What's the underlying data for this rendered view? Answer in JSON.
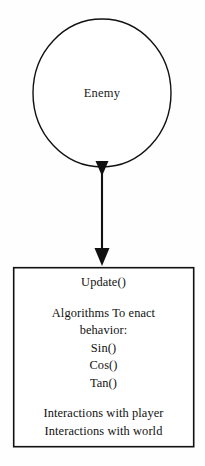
{
  "diagram": {
    "background_color": "#fefefe",
    "stroke_color": "#111111",
    "nodes": {
      "enemy": {
        "shape": "circle",
        "label": "Enemy",
        "center_x": 102,
        "center_y": 93,
        "radius": 69
      },
      "behavior": {
        "shape": "rectangle",
        "x": 13,
        "y": 267,
        "width": 181,
        "height": 180,
        "lines": [
          {
            "text": "Update()",
            "kind": "method"
          },
          {
            "text": "",
            "kind": "spacer"
          },
          {
            "text": "Algorithms To enact",
            "kind": "heading"
          },
          {
            "text": "behavior:",
            "kind": "heading"
          },
          {
            "text": "Sin()",
            "kind": "method"
          },
          {
            "text": "Cos()",
            "kind": "method"
          },
          {
            "text": "Tan()",
            "kind": "method"
          },
          {
            "text": "",
            "kind": "spacer"
          },
          {
            "text": "Interactions with player",
            "kind": "note"
          },
          {
            "text": "Interactions with world",
            "kind": "note"
          }
        ]
      }
    },
    "connector": {
      "from": "enemy",
      "to": "behavior",
      "orientation": "vertical",
      "x": 102,
      "y_start": 160,
      "y_end": 266,
      "arrowheads": 2
    }
  }
}
